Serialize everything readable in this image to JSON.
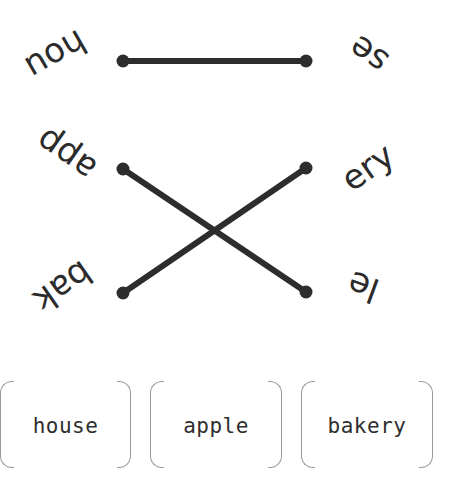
{
  "game": {
    "type": "word-fragment matching",
    "left_fragments": [
      {
        "text": "hou",
        "rotation_deg": 150
      },
      {
        "text": "app",
        "rotation_deg": 215
      },
      {
        "text": "bak",
        "rotation_deg": 145
      }
    ],
    "right_fragments": [
      {
        "text": "se",
        "rotation_deg": 215
      },
      {
        "text": "ery",
        "rotation_deg": -35
      },
      {
        "text": "le",
        "rotation_deg": 200
      }
    ],
    "connections": [
      {
        "from": "hou",
        "to": "se"
      },
      {
        "from": "app",
        "to": "le"
      },
      {
        "from": "bak",
        "to": "ery"
      }
    ],
    "answer_cards": [
      "house",
      "apple",
      "bakery"
    ],
    "colors": {
      "line": "#2d2d2d",
      "text": "#2b2b2b",
      "card_border": "#9a9a9a",
      "background": "#ffffff"
    }
  }
}
